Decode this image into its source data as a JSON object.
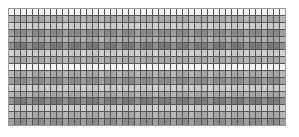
{
  "page": {
    "background_color": "#ffffff",
    "width": 299,
    "height": 137
  },
  "document": {
    "kind": "spreadsheet-grid-thumbnail",
    "has_visible_text": false,
    "description": "Dense untitled data grid rendered at thumbnail scale; no legible cell text."
  },
  "grid": {
    "columns": 46,
    "rows": 17,
    "border_color": "#9a9a9a",
    "line_color": "#555555",
    "cell_base_color": "#8c8c8c",
    "bounds": {
      "left": 8,
      "top": 8,
      "width": 278,
      "height": 118
    },
    "row_shades": [
      "shade-white",
      "shade-mid",
      "shade-light",
      "shade-dark",
      "shade-mid",
      "shade-darker",
      "shade-light",
      "shade-mid",
      "shade-white",
      "shade-mid",
      "shade-dark",
      "shade-light",
      "shade-mid",
      "shade-darker",
      "shade-light",
      "shade-mid",
      "shade-dark"
    ],
    "lit_columns": [
      0,
      3,
      6,
      9,
      12,
      15,
      18,
      21,
      24,
      27,
      30,
      33,
      36,
      39,
      42,
      45
    ]
  }
}
